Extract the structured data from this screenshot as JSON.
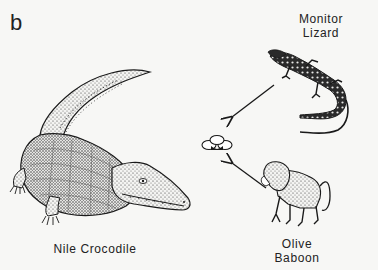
{
  "figure": {
    "panel_label": "b",
    "nodes": [
      {
        "id": "monitor",
        "label_line1": "Monitor",
        "label_line2": "Lizard",
        "icon": "monitor-lizard-illustration"
      },
      {
        "id": "eggs",
        "label": "",
        "icon": "egg-clutch-illustration"
      },
      {
        "id": "croc",
        "label": "Nile Crocodile",
        "icon": "nile-crocodile-illustration"
      },
      {
        "id": "baboon",
        "label_line1": "Olive",
        "label_line2": "Baboon",
        "icon": "olive-baboon-illustration"
      }
    ],
    "edges": [
      {
        "from": "monitor",
        "to": "eggs"
      },
      {
        "from": "baboon",
        "to": "eggs"
      }
    ],
    "colors": {
      "background": "#f7f7f5",
      "ink": "#1a1a1a"
    }
  }
}
